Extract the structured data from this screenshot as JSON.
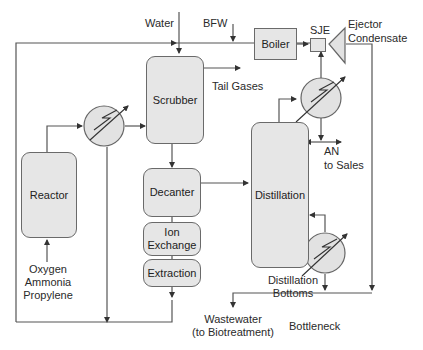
{
  "diagram": {
    "units": {
      "reactor": "Reactor",
      "scrubber": "Scrubber",
      "decanter": "Decanter",
      "ion_exchange": "Ion Exchange",
      "ion_exchange_line1": "Ion",
      "ion_exchange_line2": "Exchange",
      "extraction": "Extraction",
      "distillation": "Distillation",
      "boiler": "Boiler",
      "sje": "SJE"
    },
    "streams": {
      "water": "Water",
      "bfw": "BFW",
      "tail_gases": "Tail Gases",
      "ejector_condensate_line1": "Ejector",
      "ejector_condensate_line2": "Condensate",
      "an_to_sales_line1": "AN",
      "an_to_sales_line2": "to Sales",
      "feed_line1": "Oxygen",
      "feed_line2": "Ammonia",
      "feed_line3": "Propylene",
      "distillation_bottoms_line1": "Distillation",
      "distillation_bottoms_line2": "Bottoms",
      "wastewater_line1": "Wastewater",
      "wastewater_line2": "(to Biotreatment)"
    },
    "annotations": {
      "bottleneck": "Bottleneck"
    },
    "colors": {
      "unit_fill": "#e6e6e6",
      "line": "#555555",
      "text": "#2a2a2a"
    }
  }
}
